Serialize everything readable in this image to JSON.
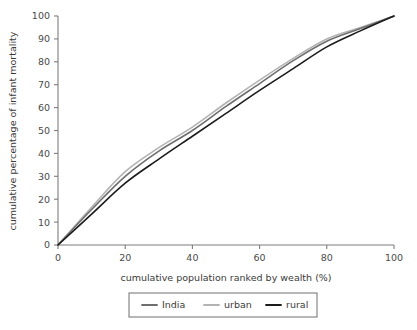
{
  "chart_data": {
    "type": "line",
    "title": "",
    "xlabel": "cumulative population ranked by wealth (%)",
    "ylabel": "cumulative percentage of infant mortality",
    "xlim": [
      0,
      100
    ],
    "ylim": [
      0,
      100
    ],
    "xticks": [
      0,
      20,
      40,
      60,
      80,
      100
    ],
    "yticks": [
      0,
      10,
      20,
      30,
      40,
      50,
      60,
      70,
      80,
      90,
      100
    ],
    "xticklabels": [
      "0",
      "20",
      "40",
      "60",
      "80",
      "100"
    ],
    "yticklabels": [
      "0",
      "10",
      "20",
      "30",
      "40",
      "50",
      "60",
      "70",
      "80",
      "90",
      "100"
    ],
    "grid": false,
    "legend_position": "below-center",
    "x": [
      0,
      10,
      20,
      30,
      40,
      50,
      60,
      70,
      80,
      90,
      100
    ],
    "series": [
      {
        "name": "India",
        "color": "#6e6e6e",
        "linewidth": 1.6,
        "values": [
          0,
          15.5,
          30.0,
          41.0,
          50.0,
          60.5,
          70.5,
          80.5,
          89.0,
          94.5,
          100
        ]
      },
      {
        "name": "urban",
        "color": "#b3b3b3",
        "linewidth": 1.6,
        "values": [
          0,
          16.5,
          32.0,
          42.5,
          51.5,
          62.0,
          72.0,
          81.5,
          90.0,
          95.0,
          100
        ]
      },
      {
        "name": "rural",
        "color": "#1c1c1c",
        "linewidth": 1.6,
        "values": [
          0,
          13.5,
          27.0,
          37.5,
          47.5,
          57.5,
          67.5,
          77.0,
          86.5,
          93.5,
          100
        ]
      }
    ]
  },
  "legend": {
    "entries": [
      {
        "label": "India",
        "color": "#6e6e6e"
      },
      {
        "label": "urban",
        "color": "#b3b3b3"
      },
      {
        "label": "rural",
        "color": "#1c1c1c"
      }
    ]
  },
  "axes": {
    "x_title": "cumulative population ranked by wealth (%)",
    "y_title": "cumulative percentage of infant mortality"
  }
}
